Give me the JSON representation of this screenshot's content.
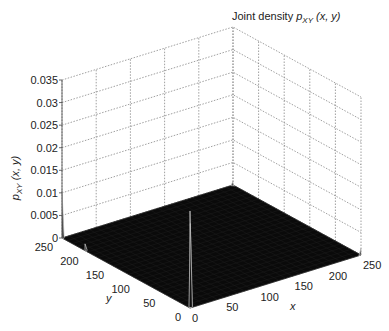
{
  "chart_data": {
    "type": "surface3d",
    "title_parts": {
      "prefix": "Joint density ",
      "var": "p",
      "sub": "XY",
      "args": " (x, y)"
    },
    "xlabel": "x",
    "ylabel": "y",
    "zlabel": "p_XY (x, y)",
    "zlabel_parts": {
      "var": "p",
      "sub": "XY",
      "args": " (x, y)"
    },
    "xlim": [
      0,
      250
    ],
    "ylim": [
      0,
      250
    ],
    "zlim": [
      0,
      0.035
    ],
    "x_ticks": [
      0,
      50,
      100,
      150,
      200,
      250
    ],
    "y_ticks": [
      0,
      50,
      100,
      150,
      200,
      250
    ],
    "z_ticks": [
      "0",
      "0.005",
      "0.01",
      "0.015",
      "0.02",
      "0.025",
      "0.03",
      "0.035"
    ],
    "z_tick_values": [
      0,
      0.005,
      0.01,
      0.015,
      0.02,
      0.025,
      0.03,
      0.035
    ],
    "grid": true,
    "surface_color": "#0a0a0a",
    "peaks": [
      {
        "x": 0,
        "y": 0,
        "z": 0.0215,
        "note": "tall spike at origin corner"
      },
      {
        "x": 2,
        "y": 2,
        "z": 0.0185
      },
      {
        "x": 0,
        "y": 250,
        "z": 0.0105,
        "note": "spike at y-axis far end"
      },
      {
        "x": 250,
        "y": 250,
        "z": 0.0008
      },
      {
        "x": 250,
        "y": 0,
        "z": 0.0015,
        "note": "small bump at x=250"
      },
      {
        "x": 0,
        "y": 205,
        "z": 0.0015,
        "note": "small bump along y edge"
      }
    ],
    "background_level": 0.0
  }
}
